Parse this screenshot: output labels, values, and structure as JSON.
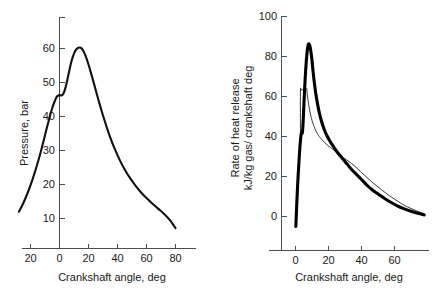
{
  "figure": {
    "background": "#ffffff",
    "curve_color": "#000000"
  },
  "chart_data": [
    {
      "type": "line",
      "id": "cylinder-pressure",
      "title": "",
      "xlabel": "Crankshaft angle, deg",
      "ylabel": "Pressure, bar",
      "xlim": [
        -30,
        90
      ],
      "ylim": [
        0,
        68
      ],
      "xticks": [
        -20,
        0,
        20,
        40,
        60,
        80
      ],
      "xticklabels": [
        "20",
        "0",
        "20",
        "40",
        "60",
        "80"
      ],
      "yticks": [
        10,
        20,
        30,
        40,
        50,
        60
      ],
      "yticklabels": [
        "10",
        "20",
        "30",
        "40",
        "50",
        "60"
      ],
      "grid": false,
      "legend": "none",
      "series": [
        {
          "name": "Cylinder pressure",
          "linewidth": "thick",
          "x": [
            -28,
            -25,
            -22,
            -19,
            -16,
            -13,
            -10,
            -7,
            -5,
            -3,
            -2,
            -1,
            0,
            1,
            2,
            3,
            4,
            5,
            6,
            7,
            8,
            9,
            10,
            11,
            12,
            13,
            14,
            15,
            16,
            17,
            18,
            20,
            22,
            24,
            26,
            28,
            30,
            33,
            36,
            39,
            42,
            45,
            48,
            52,
            56,
            60,
            64,
            68,
            72,
            76,
            80
          ],
          "y": [
            12.0,
            14.5,
            17.5,
            21.0,
            25.0,
            29.5,
            34.5,
            39.5,
            42.5,
            44.8,
            45.7,
            46.1,
            46.3,
            46.2,
            46.3,
            47.0,
            48.3,
            50.0,
            52.0,
            54.0,
            55.8,
            57.3,
            58.5,
            59.4,
            59.9,
            60.2,
            60.3,
            60.1,
            59.6,
            58.8,
            57.8,
            55.3,
            52.4,
            49.3,
            46.2,
            43.2,
            40.3,
            36.3,
            32.7,
            29.6,
            26.8,
            24.4,
            22.3,
            19.9,
            17.8,
            16.0,
            14.4,
            12.9,
            11.4,
            9.6,
            7.2
          ]
        }
      ]
    },
    {
      "type": "line",
      "id": "rate-of-heat-release",
      "title": "",
      "xlabel": "Crankshaft angle, deg",
      "ylabel_line1": "Rate of heat release",
      "ylabel_line2": "kJ/kg gas/ crankshaft deg",
      "xlim": [
        -8,
        82
      ],
      "ylim": [
        -10,
        104
      ],
      "xticks": [
        0,
        20,
        40,
        60
      ],
      "xticklabels": [
        "0",
        "20",
        "40",
        "60"
      ],
      "yticks": [
        0,
        20,
        40,
        60,
        80,
        100
      ],
      "yticklabels": [
        "0",
        "20",
        "40",
        "60",
        "80",
        "100"
      ],
      "grid": false,
      "legend": "none",
      "series": [
        {
          "name": "Measured heat release rate",
          "linewidth": "thick",
          "x": [
            0.2,
            0.6,
            1.2,
            2.0,
            2.8,
            3.4,
            3.8,
            4.0,
            4.2,
            4.6,
            5.2,
            5.8,
            6.4,
            7.0,
            7.6,
            8.2,
            8.8,
            9.4,
            10.0,
            10.6,
            11.4,
            12.2,
            13.2,
            14.4,
            15.8,
            17.4,
            19.0,
            21.0,
            23.0,
            25.5,
            28.0,
            31.0,
            34.0,
            37.0,
            40.0,
            43.5,
            47.0,
            50.5,
            54.0,
            58.0,
            62.0,
            66.0,
            70.0,
            74.0,
            78.0
          ],
          "y": [
            -5.0,
            3.0,
            14.0,
            26.0,
            36.0,
            41.0,
            42.0,
            42.0,
            42.2,
            47.0,
            58.0,
            68.0,
            76.0,
            82.0,
            85.5,
            86.3,
            85.0,
            82.0,
            78.0,
            73.0,
            67.0,
            62.0,
            57.0,
            52.0,
            47.5,
            43.5,
            40.5,
            37.5,
            35.0,
            32.0,
            29.5,
            26.5,
            23.5,
            21.0,
            18.5,
            15.5,
            13.0,
            11.0,
            9.0,
            7.0,
            5.2,
            3.8,
            2.6,
            1.6,
            0.8
          ]
        },
        {
          "name": "Predicted heat release rate",
          "linewidth": "thin",
          "x": [
            3.0,
            3.0,
            3.4,
            4.0,
            4.6,
            5.2,
            5.8,
            6.2,
            6.6,
            6.9,
            7.0,
            7.6,
            8.4,
            9.4,
            10.6,
            12.0,
            13.6,
            15.4,
            17.4,
            19.6,
            22.0,
            25.0,
            28.0,
            31.5,
            35.0,
            38.5,
            42.0,
            46.0,
            50.0,
            54.0,
            58.0,
            62.0,
            66.0,
            70.0,
            74.0,
            78.0
          ],
          "y": [
            42.0,
            62.0,
            63.0,
            63.4,
            63.6,
            63.8,
            63.9,
            64.0,
            64.0,
            63.8,
            62.0,
            58.0,
            54.0,
            50.0,
            46.5,
            43.5,
            41.0,
            39.0,
            37.2,
            35.5,
            34.0,
            32.0,
            30.0,
            28.0,
            25.8,
            23.2,
            20.5,
            17.5,
            14.8,
            12.2,
            9.8,
            7.6,
            5.6,
            4.0,
            2.6,
            1.4
          ]
        }
      ]
    }
  ]
}
